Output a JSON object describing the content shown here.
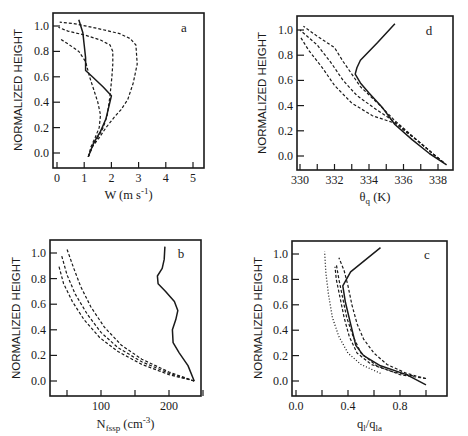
{
  "chart_data": [
    {
      "panel": "a",
      "type": "line",
      "title": "",
      "panel_label": "a",
      "xlabel": "W (m s-1)",
      "xlabel_parts": {
        "main": "W (m s",
        "sup": "-1",
        "end": ")"
      },
      "ylabel": "NORMALIZED HEIGHT",
      "xlim": [
        0,
        5.3
      ],
      "ylim": [
        -0.12,
        1.1
      ],
      "xticks": [
        0,
        1,
        2,
        3,
        4,
        5
      ],
      "xtick_labels": [
        "0",
        "1",
        "2",
        "3",
        "4",
        "5"
      ],
      "yticks": [
        0.0,
        0.2,
        0.4,
        0.6,
        0.8,
        1.0
      ],
      "ytick_labels": [
        "0.0",
        "0.2",
        "0.4",
        "0.6",
        "0.8",
        "1.0"
      ],
      "grid": false,
      "series": [
        {
          "name": "observed",
          "style": "solid",
          "x": [
            1.15,
            1.35,
            1.6,
            1.8,
            2.0,
            1.7,
            1.3,
            1.05,
            1.05,
            1.0,
            0.95,
            0.8
          ],
          "y": [
            -0.03,
            0.08,
            0.17,
            0.27,
            0.45,
            0.52,
            0.6,
            0.65,
            0.75,
            0.85,
            0.95,
            1.05
          ]
        },
        {
          "name": "model-1",
          "style": "dashed",
          "x": [
            1.15,
            1.3,
            1.55,
            1.8,
            2.1,
            2.35,
            2.6,
            2.8,
            2.95,
            2.9,
            2.7,
            2.3,
            1.5,
            0.6,
            0.1
          ],
          "y": [
            -0.03,
            0.05,
            0.12,
            0.2,
            0.28,
            0.34,
            0.42,
            0.55,
            0.7,
            0.85,
            0.9,
            0.94,
            0.98,
            1.02,
            1.03
          ]
        },
        {
          "name": "model-2",
          "style": "dashed",
          "x": [
            1.15,
            1.3,
            1.5,
            1.7,
            1.85,
            1.95,
            2.02,
            2.05,
            2.05,
            1.95,
            1.6,
            1.0,
            0.4,
            0.05
          ],
          "y": [
            -0.03,
            0.05,
            0.12,
            0.2,
            0.3,
            0.45,
            0.6,
            0.7,
            0.8,
            0.85,
            0.89,
            0.93,
            0.96,
            0.99
          ]
        },
        {
          "name": "model-3",
          "style": "dashed",
          "x": [
            1.15,
            1.25,
            1.4,
            1.55,
            1.6,
            1.5,
            1.35,
            1.2,
            1.05,
            0.8,
            0.4,
            0.1
          ],
          "y": [
            -0.03,
            0.05,
            0.12,
            0.2,
            0.3,
            0.4,
            0.5,
            0.6,
            0.72,
            0.8,
            0.86,
            0.9
          ]
        }
      ]
    },
    {
      "panel": "d",
      "type": "line",
      "title": "",
      "panel_label": "d",
      "xlabel": "θq (K)",
      "xlabel_parts": {
        "main": "θ",
        "sub": "q",
        "end": " (K)"
      },
      "ylabel": "NORMALIZED HEIGHT",
      "xlim": [
        329.8,
        339.0
      ],
      "ylim": [
        -0.12,
        1.1
      ],
      "xticks": [
        330,
        331,
        332,
        333,
        334,
        335,
        336,
        337,
        338
      ],
      "xtick_labels": [
        "330",
        "",
        "332",
        "",
        "334",
        "",
        "336",
        "",
        "338"
      ],
      "yticks": [
        0.0,
        0.2,
        0.4,
        0.6,
        0.8,
        1.0
      ],
      "ytick_labels": [
        "0.0",
        "0.2",
        "0.4",
        "0.6",
        "0.8",
        "1.0"
      ],
      "grid": false,
      "series": [
        {
          "name": "observed",
          "style": "solid",
          "x": [
            338.5,
            337.5,
            336.5,
            335.5,
            334.8,
            334.0,
            333.5,
            333.2,
            333.3,
            333.5,
            334.5,
            335.5
          ],
          "y": [
            -0.07,
            0.02,
            0.13,
            0.25,
            0.38,
            0.5,
            0.58,
            0.65,
            0.7,
            0.76,
            0.9,
            1.05
          ]
        },
        {
          "name": "model-1",
          "style": "dashed",
          "x": [
            338.3,
            337.0,
            335.5,
            334.5,
            333.5,
            333.0,
            332.5,
            332.0,
            331.0,
            330.2
          ],
          "y": [
            -0.05,
            0.1,
            0.28,
            0.42,
            0.55,
            0.65,
            0.75,
            0.86,
            0.95,
            1.03
          ]
        },
        {
          "name": "model-2",
          "style": "dashed",
          "x": [
            338.3,
            337.0,
            335.5,
            334.3,
            333.3,
            332.5,
            331.8,
            331.0,
            330.0
          ],
          "y": [
            -0.05,
            0.1,
            0.27,
            0.38,
            0.48,
            0.6,
            0.74,
            0.88,
            1.0
          ]
        },
        {
          "name": "model-3",
          "style": "dashed",
          "x": [
            338.3,
            337.0,
            335.5,
            334.2,
            333.0,
            332.0,
            331.3,
            330.5,
            330.0
          ],
          "y": [
            -0.05,
            0.1,
            0.26,
            0.32,
            0.42,
            0.56,
            0.7,
            0.84,
            0.95
          ]
        }
      ]
    },
    {
      "panel": "b",
      "type": "line",
      "title": "",
      "panel_label": "b",
      "xlabel": "Nfssp (cm-3)",
      "xlabel_parts": {
        "main": "N",
        "sub": "fssp",
        "mid": " (cm",
        "sup": "-3",
        "end": ")"
      },
      "ylabel": "NORMALIZED HEIGHT",
      "xlim": [
        25,
        250
      ],
      "ylim": [
        -0.12,
        1.1
      ],
      "xticks": [
        50,
        100,
        150,
        200,
        250
      ],
      "xtick_labels": [
        "",
        "100",
        "",
        "200",
        ""
      ],
      "yticks": [
        0.0,
        0.2,
        0.4,
        0.6,
        0.8,
        1.0
      ],
      "ytick_labels": [
        "0.0",
        "0.2",
        "0.4",
        "0.6",
        "0.8",
        "1.0"
      ],
      "grid": false,
      "series": [
        {
          "name": "observed",
          "style": "solid",
          "x": [
            237,
            228,
            215,
            206,
            205,
            210,
            213,
            208,
            195,
            184,
            183,
            190,
            193,
            194
          ],
          "y": [
            0.0,
            0.12,
            0.22,
            0.3,
            0.4,
            0.48,
            0.55,
            0.62,
            0.7,
            0.76,
            0.82,
            0.88,
            0.95,
            1.05
          ]
        },
        {
          "name": "model-1",
          "style": "dashed",
          "x": [
            237,
            200,
            160,
            130,
            105,
            85,
            70,
            60,
            50
          ],
          "y": [
            0.0,
            0.07,
            0.17,
            0.28,
            0.42,
            0.58,
            0.74,
            0.88,
            1.03
          ]
        },
        {
          "name": "model-2",
          "style": "dashed",
          "x": [
            237,
            200,
            160,
            125,
            100,
            80,
            62,
            50,
            42
          ],
          "y": [
            0.0,
            0.06,
            0.15,
            0.26,
            0.38,
            0.52,
            0.68,
            0.83,
            0.98
          ]
        },
        {
          "name": "model-3",
          "style": "dashed",
          "x": [
            237,
            200,
            160,
            125,
            98,
            75,
            58,
            45,
            38
          ],
          "y": [
            0.0,
            0.05,
            0.13,
            0.23,
            0.34,
            0.48,
            0.62,
            0.76,
            0.9
          ]
        }
      ]
    },
    {
      "panel": "c",
      "type": "line",
      "title": "",
      "panel_label": "c",
      "xlabel": "ql/qla",
      "xlabel_parts": {
        "a": "q",
        "a_sub": "l",
        "slash": "/",
        "b": "q",
        "b_sub": "la"
      },
      "ylabel": "NORMALIZED HEIGHT",
      "xlim": [
        -0.03,
        1.03
      ],
      "ylim": [
        -0.12,
        1.1
      ],
      "xticks": [
        0.0,
        0.2,
        0.4,
        0.6,
        0.8,
        1.0
      ],
      "xtick_labels": [
        "0.0",
        "",
        "0.4",
        "",
        "0.8",
        ""
      ],
      "yticks": [
        0.0,
        0.2,
        0.4,
        0.6,
        0.8,
        1.0
      ],
      "ytick_labels": [
        "0.0",
        "0.2",
        "0.4",
        "0.6",
        "0.8",
        "1.0"
      ],
      "grid": false,
      "series": [
        {
          "name": "observed",
          "style": "solid",
          "x": [
            1.0,
            0.85,
            0.65,
            0.52,
            0.46,
            0.42,
            0.38,
            0.36,
            0.42,
            0.65
          ],
          "y": [
            -0.03,
            0.05,
            0.12,
            0.2,
            0.28,
            0.45,
            0.62,
            0.75,
            0.86,
            1.05
          ]
        },
        {
          "name": "model-1",
          "style": "dashed",
          "x": [
            1.0,
            0.85,
            0.7,
            0.6,
            0.52,
            0.47,
            0.43,
            0.4,
            0.37,
            0.33
          ],
          "y": [
            0.02,
            0.06,
            0.13,
            0.22,
            0.33,
            0.45,
            0.6,
            0.75,
            0.87,
            0.97
          ]
        },
        {
          "name": "model-2",
          "style": "dashed",
          "x": [
            1.0,
            0.8,
            0.62,
            0.5,
            0.44,
            0.39,
            0.36,
            0.33,
            0.31
          ],
          "y": [
            0.02,
            0.05,
            0.12,
            0.22,
            0.35,
            0.5,
            0.65,
            0.8,
            0.92
          ]
        },
        {
          "name": "model-3",
          "style": "dashed",
          "x": [
            0.9,
            0.75,
            0.58,
            0.47,
            0.41,
            0.37,
            0.34,
            0.31,
            0.3
          ],
          "y": [
            0.04,
            0.07,
            0.13,
            0.22,
            0.35,
            0.5,
            0.65,
            0.8,
            0.9
          ]
        },
        {
          "name": "adiabatic-limit",
          "style": "dotted",
          "x": [
            0.65,
            0.5,
            0.4,
            0.33,
            0.28,
            0.25,
            0.23,
            0.22
          ],
          "y": [
            0.06,
            0.13,
            0.22,
            0.35,
            0.5,
            0.68,
            0.85,
            1.02
          ]
        }
      ]
    }
  ]
}
